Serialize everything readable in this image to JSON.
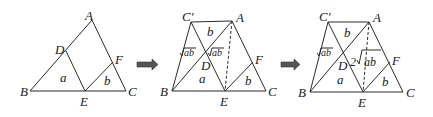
{
  "diagram": {
    "type": "geometry-transformation-sequence",
    "arrow_icon": "right-arrow",
    "panels": [
      {
        "id": "panel-1",
        "points": {
          "A": "A",
          "B": "B",
          "C": "C",
          "D": "D",
          "E": "E",
          "F": "F"
        },
        "regions": {
          "left_triangle": "a",
          "right_triangle": "b"
        }
      },
      {
        "id": "panel-2",
        "points": {
          "A": "A",
          "B": "B",
          "C": "C",
          "Cp": "C′",
          "D": "D",
          "E": "E",
          "F": "F"
        },
        "regions": {
          "top": "b",
          "left": "√ab",
          "right": "√ab",
          "bottom": "a",
          "right_triangle": "b"
        },
        "sqrt_body": "ab"
      },
      {
        "id": "panel-3",
        "points": {
          "A": "A",
          "B": "B",
          "C": "C",
          "Cp": "C′",
          "D": "D",
          "E": "E",
          "F": "F"
        },
        "regions": {
          "top": "b",
          "left": "√ab",
          "middle_coef": "2",
          "bottom": "a",
          "right_triangle": "b"
        },
        "sqrt_body": "ab"
      }
    ]
  }
}
